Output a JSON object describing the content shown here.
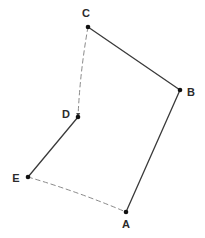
{
  "figure": {
    "kind": "geometry-diagram",
    "width": 205,
    "height": 238,
    "background_color": "#ffffff",
    "solid_stroke_color": "#3a3a3a",
    "dashed_stroke_color": "#8a8a8a",
    "vertex_dot_color": "#111111",
    "label_color": "#2b2b2b"
  },
  "chart_data": {
    "type": "diagram",
    "title": "",
    "xlabel": "",
    "ylabel": "",
    "grid": false,
    "legend": false,
    "xlim": [
      0,
      205
    ],
    "ylim": [
      0,
      238
    ],
    "points": [
      {
        "label": "A",
        "x": 126,
        "y": 212,
        "label_x": 126,
        "label_y": 224,
        "label_position": "below"
      },
      {
        "label": "B",
        "x": 180,
        "y": 90,
        "label_x": 191,
        "label_y": 92,
        "label_position": "right"
      },
      {
        "label": "C",
        "x": 88,
        "y": 27,
        "label_x": 86,
        "label_y": 13,
        "label_position": "above"
      },
      {
        "label": "D",
        "x": 78,
        "y": 117,
        "label_x": 66,
        "label_y": 114,
        "label_position": "left"
      },
      {
        "label": "E",
        "x": 28,
        "y": 177,
        "label_x": 16,
        "label_y": 178,
        "label_position": "left"
      }
    ],
    "edges": [
      {
        "from": "C",
        "to": "B",
        "style": "solid",
        "arrow": false
      },
      {
        "from": "B",
        "to": "A",
        "style": "solid",
        "arrow": false
      },
      {
        "from": "D",
        "to": "E",
        "style": "solid",
        "arrow": false
      },
      {
        "from": "C",
        "to": "D",
        "style": "dashed",
        "arrow": true
      },
      {
        "from": "E",
        "to": "A",
        "style": "dashed",
        "arrow": false
      }
    ]
  },
  "labels": {
    "a": "A",
    "b": "B",
    "c": "C",
    "d": "D",
    "e": "E"
  }
}
